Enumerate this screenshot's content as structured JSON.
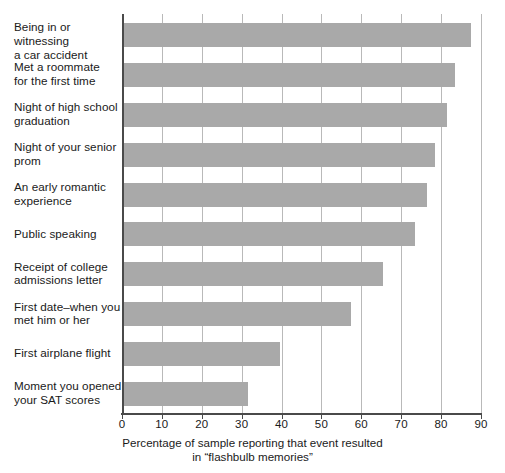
{
  "chart_data": {
    "type": "bar",
    "orientation": "horizontal",
    "title": "",
    "subtitle": "",
    "xlabel_line1": "Percentage of sample reporting that event resulted",
    "xlabel_line2": "in “flashbulb memories”",
    "ylabel": "",
    "xlim": [
      0,
      90
    ],
    "grid": true,
    "grid_axis": "x",
    "legend": "none",
    "bar_color": "#a9a9a9",
    "axis_color": "#4a4a4a",
    "gridline_color": "#b9b9b9",
    "xticks": [
      0,
      10,
      20,
      30,
      40,
      50,
      60,
      70,
      80,
      90
    ],
    "xticklabels": [
      "0",
      "10",
      "20",
      "30",
      "40",
      "50",
      "60",
      "70",
      "80",
      "90"
    ],
    "categories": [
      "Being in or witnessing a car accident",
      "Met a roommate for the first time",
      "Night of high school graduation",
      "Night of your senior prom",
      "An early romantic experience",
      "Public speaking",
      "Receipt of college admissions letter",
      "First date–when you met him or her",
      "First airplane flight",
      "Moment you opened your SAT scores"
    ],
    "category_lines": [
      [
        "Being in or witnessing",
        "a car accident"
      ],
      [
        "Met a roommate",
        "for the first time"
      ],
      [
        "Night of high school",
        "graduation"
      ],
      [
        "Night of your senior",
        "prom"
      ],
      [
        "An early romantic",
        "experience"
      ],
      [
        "Public speaking"
      ],
      [
        "Receipt of college",
        "admissions letter"
      ],
      [
        "First date–when you",
        "met him or her"
      ],
      [
        "First airplane flight"
      ],
      [
        "Moment you opened",
        "your SAT scores"
      ]
    ],
    "values": [
      87,
      83,
      81,
      78,
      76,
      73,
      65,
      57,
      39,
      31
    ]
  }
}
